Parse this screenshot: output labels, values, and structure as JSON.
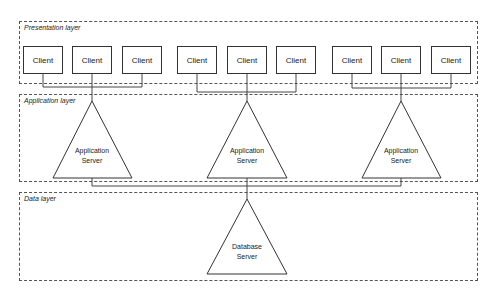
{
  "layers": {
    "presentation": {
      "label": "Presentation layer"
    },
    "application": {
      "label": "Application layer"
    },
    "data": {
      "label": "Data layer"
    }
  },
  "clients": [
    {
      "label": "Client"
    },
    {
      "label": "Client"
    },
    {
      "label": "Client"
    },
    {
      "label": "Client"
    },
    {
      "label": "Client"
    },
    {
      "label": "Client"
    },
    {
      "label": "Client"
    },
    {
      "label": "Client"
    },
    {
      "label": "Client"
    }
  ],
  "app_servers": [
    {
      "line1": "Application",
      "line2": "Server"
    },
    {
      "line1": "Application",
      "line2": "Server"
    },
    {
      "line1": "Application",
      "line2": "Server"
    }
  ],
  "database_server": {
    "line1": "Database",
    "line2": "Server"
  },
  "colors": {
    "stroke": "#333333",
    "dashed": "#555555",
    "background": "#ffffff"
  }
}
